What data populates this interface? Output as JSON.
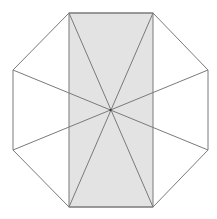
{
  "figure": {
    "colors": {
      "background": "#ffffff",
      "stroke": "#7a7a7a",
      "shaded_fill": "#e3e3e3"
    },
    "stroke_width": 1,
    "center": [
      110.5,
      110
    ],
    "octagon_vertices": [
      [
        69,
        13
      ],
      [
        153,
        13
      ],
      [
        208,
        70
      ],
      [
        208,
        150
      ],
      [
        153,
        207
      ],
      [
        69,
        207
      ],
      [
        13,
        150
      ],
      [
        13,
        70
      ]
    ],
    "shaded_rectangle": {
      "x": 69,
      "y": 13,
      "width": 84,
      "height": 194
    },
    "diagonals": [
      [
        [
          69,
          13
        ],
        [
          153,
          207
        ]
      ],
      [
        [
          153,
          13
        ],
        [
          69,
          207
        ]
      ],
      [
        [
          13,
          70
        ],
        [
          208,
          150
        ]
      ],
      [
        [
          208,
          70
        ],
        [
          13,
          150
        ]
      ]
    ]
  }
}
